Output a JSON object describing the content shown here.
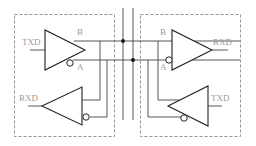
{
  "diagram": {
    "type": "RS-485 half-duplex transceiver connection schematic",
    "left_node": {
      "driver": {
        "input_label": "TXD",
        "output_noninverting_label": "B",
        "output_inverting_label": "A"
      },
      "receiver": {
        "output_label": "RXD"
      }
    },
    "right_node": {
      "receiver": {
        "input_noninverting_label": "B",
        "input_inverting_label": "A",
        "output_label": "RXD"
      },
      "driver": {
        "input_label": "TXD"
      }
    },
    "bus": {
      "lines": [
        "B",
        "A"
      ],
      "junction_count": 2
    },
    "colors": {
      "wire": "#444444",
      "box": "#888888",
      "label": "#9a9a9a",
      "background": "#ffffff"
    }
  }
}
